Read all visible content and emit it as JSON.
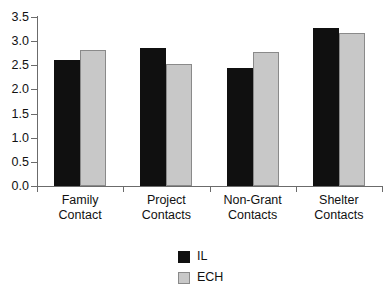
{
  "chart_data": {
    "type": "bar",
    "title": "",
    "subtitle": "",
    "xlabel": "",
    "ylabel": "",
    "ylim": [
      0.0,
      3.5
    ],
    "ytick_labels": [
      "0.0",
      "0.5",
      "1.0",
      "1.5",
      "2.0",
      "2.5",
      "3.0",
      "3.5"
    ],
    "ytick_values": [
      0.0,
      0.5,
      1.0,
      1.5,
      2.0,
      2.5,
      3.0,
      3.5
    ],
    "grid": false,
    "legend_position": "bottom-center",
    "categories": [
      {
        "line1": "Family",
        "line2": "Contact"
      },
      {
        "line1": "Project",
        "line2": "Contacts"
      },
      {
        "line1": "Non-Grant",
        "line2": "Contacts"
      },
      {
        "line1": "Shelter",
        "line2": "Contacts"
      }
    ],
    "series": [
      {
        "name": "IL",
        "color": "#101010",
        "values": [
          2.61,
          2.85,
          2.44,
          3.28
        ]
      },
      {
        "name": "ECH",
        "color": "#c8c8c8",
        "values": [
          2.82,
          2.53,
          2.77,
          3.17
        ]
      }
    ]
  },
  "legend": {
    "items": [
      {
        "label": "IL",
        "swatch": "black-swatch"
      },
      {
        "label": "ECH",
        "swatch": "gray-swatch"
      }
    ]
  },
  "axis": {
    "line_color": "#6b6b6b"
  }
}
